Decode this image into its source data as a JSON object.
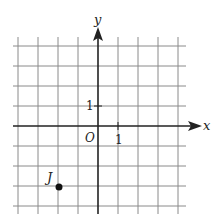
{
  "chart_data": {
    "type": "scatter",
    "title": "",
    "xlabel": "x",
    "ylabel": "y",
    "xlim": [
      -4,
      4
    ],
    "ylim": [
      -4,
      4
    ],
    "grid": true,
    "origin_label": "O",
    "tick_labels": {
      "x_unit": "1",
      "y_unit": "1"
    },
    "points": [
      {
        "label": "J",
        "x": -2,
        "y": -3
      }
    ]
  },
  "axes": {
    "x_label": "x",
    "y_label": "y",
    "origin": "O",
    "x_tick": "1",
    "y_tick": "1"
  },
  "point": {
    "label": "J"
  },
  "colors": {
    "grid": "#8a8a8a",
    "axis": "#222222",
    "point": "#111111"
  }
}
